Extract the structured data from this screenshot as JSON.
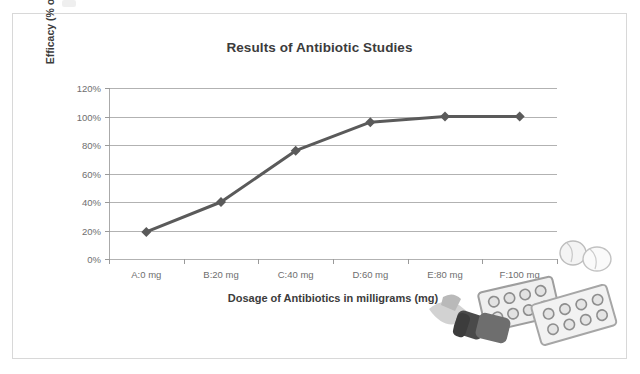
{
  "chart_data": {
    "type": "line",
    "title": "Results of Antibiotic Studies",
    "xlabel": "Dosage of Antibiotics in milligrams (mg)",
    "ylabel": "Efficacy (% of participants cured)",
    "categories": [
      "A:0 mg",
      "B:20 mg",
      "C:40 mg",
      "D:60 mg",
      "E:80 mg",
      "F:100 mg"
    ],
    "values": [
      19,
      40,
      76,
      96,
      100,
      100
    ],
    "series": [
      {
        "name": "Efficacy",
        "values": [
          19,
          40,
          76,
          96,
          100,
          100
        ],
        "color": "#5a5a5a",
        "marker": "diamond"
      }
    ],
    "ylim": [
      0,
      120
    ],
    "ytick_values": [
      0,
      20,
      40,
      60,
      80,
      100,
      120
    ],
    "ytick_labels": [
      "0%",
      "20%",
      "40%",
      "60%",
      "80%",
      "100%",
      "120%"
    ],
    "grid": "horizontal",
    "legend": "none",
    "xlim_categories": 6
  },
  "chart": {
    "title": "Results of Antibiotic Studies",
    "x_axis_title": "Dosage of Antibiotics in milligrams (mg)",
    "y_axis_title": "Efficacy (% of participants cured)"
  },
  "colors": {
    "series": "#5a5a5a",
    "gridline": "#b2b2b2",
    "axis": "#9a9a9a",
    "frame_border": "#d8d8d8",
    "text": "#3c3c3c",
    "tick_text": "#6e6e6e",
    "background": "#ffffff"
  },
  "decoration": {
    "clipart_name": "pills-and-blister-packs-clipart"
  }
}
